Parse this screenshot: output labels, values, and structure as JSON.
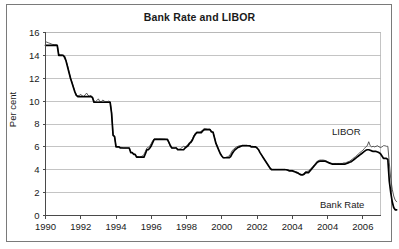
{
  "figure": {
    "title": "Bank Rate and LIBOR"
  },
  "annotations": {
    "libor_label": "LIBOR",
    "bankrate_label": "Bank Rate"
  },
  "chart_data": {
    "type": "line",
    "title": "Bank Rate and LIBOR",
    "xlabel": "",
    "ylabel": "Per cent",
    "ylim": [
      0,
      16
    ],
    "ytick_labels": [
      "0",
      "2",
      "4",
      "6",
      "8",
      "10",
      "12",
      "14",
      "16"
    ],
    "yticks": [
      0,
      2,
      4,
      6,
      8,
      10,
      12,
      14,
      16
    ],
    "xlim": [
      1990,
      2009
    ],
    "xticks": [
      1990,
      1992,
      1994,
      1996,
      1998,
      2000,
      2002,
      2004,
      2006,
      2008
    ],
    "xtick_labels": [
      "1990",
      "1992",
      "1994",
      "1996",
      "1998",
      "2000",
      "2002",
      "2004",
      "2004",
      "2006"
    ],
    "grid": "horizontal",
    "legend_position": "inline-annotation",
    "colors": {
      "bank_rate": "#000000",
      "libor": "#3d3d3d",
      "gridline": "#b5b5b5",
      "axis": "#4a4a4a"
    },
    "x_start": 1990.0,
    "x_step": 0.08333,
    "series": [
      {
        "name": "Bank Rate",
        "values": [
          14.88,
          14.88,
          14.88,
          14.88,
          14.88,
          14.88,
          14.88,
          14.88,
          14.88,
          14.0,
          14.0,
          14.0,
          14.0,
          13.88,
          13.5,
          13.0,
          12.5,
          12.0,
          11.6,
          11.2,
          10.8,
          10.5,
          10.4,
          10.4,
          10.4,
          10.4,
          10.4,
          10.4,
          10.4,
          10.4,
          10.4,
          10.4,
          10.3,
          9.9,
          9.9,
          9.9,
          9.9,
          9.9,
          9.9,
          9.9,
          9.9,
          9.9,
          9.9,
          9.9,
          9.9,
          8.9,
          7.0,
          6.9,
          6.0,
          6.0,
          6.0,
          5.9,
          5.9,
          5.9,
          5.9,
          5.9,
          5.9,
          5.9,
          5.5,
          5.5,
          5.35,
          5.35,
          5.1,
          5.1,
          5.1,
          5.1,
          5.1,
          5.1,
          5.4,
          5.75,
          5.75,
          5.9,
          6.1,
          6.4,
          6.65,
          6.65,
          6.65,
          6.65,
          6.65,
          6.65,
          6.65,
          6.65,
          6.65,
          6.65,
          6.4,
          6.1,
          5.9,
          5.9,
          5.9,
          5.9,
          5.75,
          5.75,
          5.75,
          5.75,
          5.75,
          5.9,
          6.0,
          6.1,
          6.3,
          6.4,
          6.6,
          6.9,
          7.1,
          7.25,
          7.25,
          7.25,
          7.25,
          7.4,
          7.5,
          7.5,
          7.5,
          7.5,
          7.5,
          7.3,
          7.3,
          6.8,
          6.3,
          6.0,
          5.7,
          5.4,
          5.2,
          5.05,
          5.05,
          5.05,
          5.05,
          5.05,
          5.15,
          5.4,
          5.6,
          5.75,
          5.85,
          5.95,
          6.0,
          6.05,
          6.1,
          6.1,
          6.1,
          6.1,
          6.1,
          6.1,
          6.0,
          6.0,
          6.0,
          6.0,
          5.9,
          5.75,
          5.5,
          5.3,
          5.1,
          4.9,
          4.7,
          4.5,
          4.3,
          4.1,
          4.0,
          4.0,
          4.0,
          4.0,
          4.0,
          4.0,
          4.0,
          4.0,
          4.0,
          4.0,
          4.0,
          3.95,
          3.9,
          3.9,
          3.9,
          3.85,
          3.8,
          3.75,
          3.7,
          3.6,
          3.55,
          3.55,
          3.6,
          3.75,
          3.75,
          3.75,
          3.9,
          4.05,
          4.2,
          4.35,
          4.5,
          4.65,
          4.72,
          4.75,
          4.75,
          4.75,
          4.75,
          4.72,
          4.65,
          4.6,
          4.55,
          4.5,
          4.5,
          4.5,
          4.5,
          4.5,
          4.5,
          4.5,
          4.5,
          4.5,
          4.5,
          4.55,
          4.6,
          4.65,
          4.7,
          4.8,
          4.9,
          5.0,
          5.1,
          5.2,
          5.3,
          5.4,
          5.5,
          5.6,
          5.7,
          5.75,
          5.75,
          5.7,
          5.65,
          5.6,
          5.6,
          5.6,
          5.55,
          5.5,
          5.4,
          5.2,
          5.0,
          5.0,
          5.0,
          4.9,
          3.0,
          2.0,
          1.2,
          0.7,
          0.5,
          0.5
        ]
      },
      {
        "name": "LIBOR",
        "values": [
          15.2,
          15.15,
          15.1,
          15.05,
          15.0,
          14.95,
          14.95,
          14.95,
          14.9,
          14.1,
          14.05,
          14.05,
          14.0,
          13.7,
          13.55,
          13.1,
          12.55,
          12.05,
          11.65,
          11.25,
          10.85,
          10.55,
          10.45,
          10.5,
          10.6,
          10.45,
          10.4,
          10.55,
          10.7,
          10.5,
          10.45,
          10.5,
          10.35,
          10.0,
          9.95,
          10.05,
          10.2,
          9.95,
          9.95,
          10.1,
          10.0,
          9.95,
          9.95,
          10.0,
          9.95,
          9.0,
          7.1,
          6.95,
          6.05,
          6.0,
          6.0,
          5.95,
          5.95,
          5.9,
          5.9,
          5.9,
          5.9,
          5.9,
          5.55,
          5.5,
          5.4,
          5.35,
          5.15,
          5.15,
          5.1,
          5.15,
          5.2,
          5.35,
          5.6,
          5.9,
          5.95,
          6.1,
          6.3,
          6.55,
          6.7,
          6.7,
          6.7,
          6.7,
          6.7,
          6.7,
          6.68,
          6.68,
          6.65,
          6.6,
          6.35,
          6.05,
          5.9,
          5.9,
          5.9,
          5.95,
          5.8,
          5.8,
          5.85,
          5.95,
          6.05,
          6.0,
          6.1,
          6.2,
          6.4,
          6.5,
          6.7,
          7.0,
          7.2,
          7.3,
          7.3,
          7.3,
          7.35,
          7.5,
          7.6,
          7.6,
          7.55,
          7.55,
          7.55,
          7.35,
          7.3,
          6.85,
          6.35,
          6.05,
          5.7,
          5.4,
          5.2,
          5.05,
          5.05,
          5.1,
          5.15,
          5.2,
          5.4,
          5.65,
          5.8,
          5.9,
          6.0,
          6.05,
          6.1,
          6.1,
          6.15,
          6.15,
          6.15,
          6.15,
          6.1,
          6.1,
          6.05,
          6.05,
          6.0,
          6.0,
          5.9,
          5.75,
          5.5,
          5.3,
          5.1,
          4.9,
          4.7,
          4.5,
          4.3,
          4.15,
          4.05,
          4.05,
          4.05,
          4.05,
          4.05,
          4.05,
          4.05,
          4.05,
          4.05,
          4.05,
          4.0,
          4.0,
          3.95,
          3.95,
          3.95,
          3.9,
          3.85,
          3.8,
          3.75,
          3.65,
          3.6,
          3.6,
          3.7,
          3.85,
          3.85,
          3.9,
          4.0,
          4.15,
          4.3,
          4.45,
          4.6,
          4.75,
          4.82,
          4.85,
          4.85,
          4.85,
          4.82,
          4.78,
          4.7,
          4.65,
          4.6,
          4.55,
          4.55,
          4.55,
          4.55,
          4.55,
          4.55,
          4.55,
          4.55,
          4.6,
          4.6,
          4.65,
          4.7,
          4.75,
          4.85,
          4.95,
          5.05,
          5.15,
          5.25,
          5.4,
          5.5,
          5.6,
          5.7,
          5.85,
          6.0,
          6.1,
          6.45,
          6.1,
          6.0,
          6.05,
          6.0,
          6.05,
          6.1,
          6.0,
          5.95,
          6.0,
          6.1,
          6.1,
          6.05,
          6.05,
          4.6,
          3.2,
          2.3,
          1.7,
          1.35,
          1.2
        ]
      }
    ]
  }
}
